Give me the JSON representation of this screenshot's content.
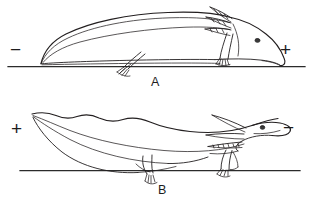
{
  "figure": {
    "background_color": "#ffffff",
    "ink_color": "#231f20",
    "type": "line-drawing"
  },
  "panels": [
    {
      "id": "A",
      "label": "A",
      "electrode_left": "−",
      "electrode_right": "+",
      "baseline_y": 66,
      "description": "larva lying flat along the baseline, head to the right at the positive pole, external gills directed up and back, tail tapering to a point at the left"
    },
    {
      "id": "B",
      "label": "B",
      "electrode_left": "+",
      "electrode_right": "−",
      "baseline_y": 170,
      "description": "larva with body arched upward and head raised to the right at the negative pole, forelimb and hindlimb reaching down to the baseline, wavy dorsal crest"
    }
  ],
  "annotations": {
    "plus_sign": "+",
    "minus_sign": "−",
    "panel_a_label": "A",
    "panel_b_label": "B"
  },
  "icons": {
    "electrode_positive": "plus-sign-icon",
    "electrode_negative": "minus-sign-icon"
  }
}
